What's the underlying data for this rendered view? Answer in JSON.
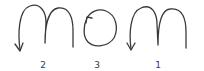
{
  "diagram": {
    "word": "mom",
    "stroke_color": "#3a3a3a",
    "letters": [
      {
        "letter": "m",
        "order_label": "2",
        "arrow": "down-left at end of stroke",
        "x": 43
      },
      {
        "letter": "o",
        "order_label": "3",
        "arrow": "counter-clockwise start at upper-left",
        "x": 97
      },
      {
        "letter": "m",
        "order_label": "1",
        "arrow": "down-left at end of stroke",
        "x": 158
      }
    ]
  }
}
